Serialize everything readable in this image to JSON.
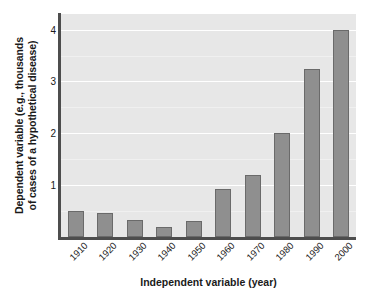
{
  "chart_data": {
    "type": "bar",
    "title": "",
    "xlabel": "Independent variable (year)",
    "ylabel": "Dependent variable (e.g., thousands of cases of a hypothetical disease)",
    "ylabel_lines": [
      "Dependent variable (e.g., thousands",
      "of cases of a hypothetical disease)"
    ],
    "categories": [
      "1910",
      "1920",
      "1930",
      "1940",
      "1950",
      "1960",
      "1970",
      "1980",
      "1990",
      "2000"
    ],
    "values": [
      0.5,
      0.47,
      0.33,
      0.2,
      0.3,
      0.92,
      1.2,
      2.0,
      3.25,
      4.0
    ],
    "ylim": [
      0,
      4.3
    ],
    "xlim_categories": 10,
    "yticks": [
      1,
      2,
      3,
      4
    ],
    "ytick_labels": [
      "1",
      "2",
      "3",
      "4"
    ],
    "gridlines_major": [
      1,
      2,
      3,
      4
    ],
    "gridlines_minor": [
      0.5,
      1.5,
      2.5,
      3.5
    ],
    "grid": true,
    "legend": false,
    "legend_position": "none",
    "xtick_rotation": -45,
    "colors": {
      "bar_fill": "#8f8f8f",
      "bar_edge": "#6a6a6a",
      "plot_background": "#e7e7e7",
      "figure_background": "#ffffff",
      "gridline": "#ffffff",
      "axis_line": "#4d4d4d",
      "text": "#1a1a1a"
    }
  }
}
